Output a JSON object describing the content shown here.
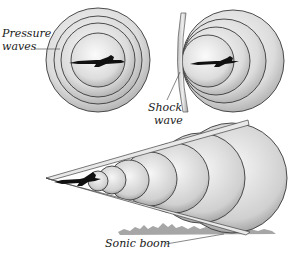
{
  "labels": {
    "pressure_waves_line1": "Pressure",
    "pressure_waves_line2": "waves",
    "shock_wave_line1": "Shock",
    "shock_wave_line2": "wave",
    "sonic_boom": "Sonic boom"
  },
  "panels": [
    {
      "name": "subsonic",
      "description": "Concentric pressure waves around slow aircraft"
    },
    {
      "name": "sonic",
      "description": "Pressure waves bunch up ahead of aircraft forming a shock wave"
    },
    {
      "name": "supersonic",
      "description": "Mach cone trailing aircraft; shock cone reaches ground as sonic boom"
    }
  ],
  "colors": {
    "wave_fill_light": "#f4f4f4",
    "wave_fill_dark": "#b8b8b8",
    "wave_stroke": "#3a3a3a",
    "aircraft": "#111111",
    "ground": "#9a9a9a",
    "shock_bar": "#dcdcdc"
  }
}
